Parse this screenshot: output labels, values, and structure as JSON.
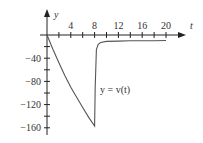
{
  "chart_data": {
    "type": "line",
    "title": "",
    "xlabel": "t",
    "ylabel": "y",
    "curve_label": "y = v(t)",
    "xlim": [
      0,
      22
    ],
    "ylim": [
      -165,
      10
    ],
    "x_ticks_labeled": [
      4,
      8,
      12,
      16,
      20
    ],
    "x_ticks_minor": [
      2,
      4,
      6,
      8,
      10,
      12,
      14,
      16,
      18,
      20
    ],
    "y_ticks_labeled": [
      -40,
      -80,
      -120,
      -160
    ],
    "y_ticks_minor": [
      -20,
      -40,
      -60,
      -80,
      -100,
      -120,
      -140,
      -160
    ],
    "grid": false,
    "series": [
      {
        "name": "v(t)",
        "x": [
          0,
          1,
          2,
          3,
          4,
          5,
          6,
          7,
          8,
          8.1,
          8.3,
          8.6,
          9,
          10,
          12,
          14,
          16,
          18,
          20
        ],
        "values": [
          0,
          -25,
          -48,
          -70,
          -90,
          -108,
          -125,
          -142,
          -157,
          -90,
          -25,
          -16,
          -13,
          -11,
          -10.5,
          -10,
          -10,
          -10,
          -9.5
        ]
      }
    ],
    "colors": {
      "axis": "#222222",
      "curve": "#555555",
      "text": "#333333"
    }
  }
}
